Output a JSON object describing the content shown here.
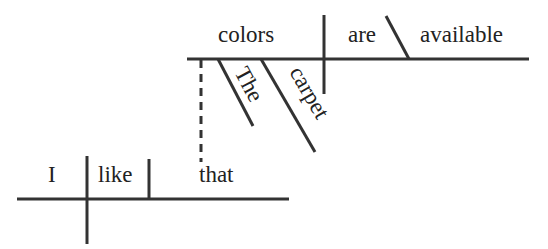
{
  "diagram": {
    "type": "sentence-diagram (Reed-Kellogg)",
    "main_clause": {
      "subject": "I",
      "verb": "like",
      "direct_object": "that"
    },
    "relative_clause": {
      "subject": "colors",
      "verb": "are",
      "predicate_adjective": "available",
      "subject_modifiers": [
        "The",
        "carpet"
      ],
      "connector": "that"
    },
    "colors": {
      "line": "#333333",
      "text": "#222222",
      "background": "#ffffff"
    }
  }
}
